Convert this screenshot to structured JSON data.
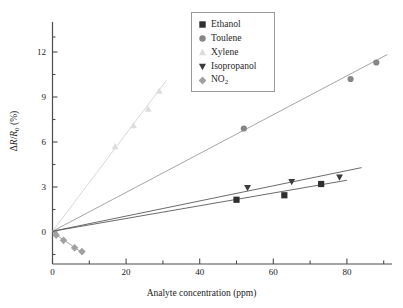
{
  "chart_data": {
    "type": "scatter",
    "title": "",
    "xlabel": "Analyte concentration (ppm)",
    "ylabel": "ΔR/R₀ (%)",
    "xlim": [
      -3,
      92
    ],
    "ylim": [
      -2.1,
      13.6
    ],
    "xticks": [
      0,
      20,
      40,
      60,
      80
    ],
    "yticks": [
      0,
      3,
      6,
      9,
      12
    ],
    "xticklabels": [
      "0",
      "20",
      "40",
      "60",
      "80"
    ],
    "yticklabels": [
      "0",
      "3",
      "6",
      "9",
      "12"
    ],
    "grid": false,
    "legend_position": "top-center-right",
    "fit_lines": true,
    "series": [
      {
        "name": "Ethanol",
        "marker": "square",
        "color": "#2f2f2f",
        "points": [
          [
            50.0,
            2.15
          ],
          [
            63.0,
            2.45
          ],
          [
            73.0,
            3.2
          ]
        ],
        "fit": {
          "slope": 0.0425,
          "intercept": 0.05,
          "x_start": 0,
          "x_end": 80
        }
      },
      {
        "name": "Toulene",
        "marker": "circle",
        "color": "#868686",
        "points": [
          [
            52.0,
            6.9
          ],
          [
            81.0,
            10.2
          ],
          [
            88.0,
            11.3
          ]
        ],
        "fit": {
          "slope": 0.1295,
          "intercept": 0.05,
          "x_start": 0,
          "x_end": 91
        }
      },
      {
        "name": "Xylene",
        "marker": "triangle-up",
        "color": "#dcdcdc",
        "points": [
          [
            17.0,
            5.7
          ],
          [
            22.0,
            7.1
          ],
          [
            26.0,
            8.2
          ],
          [
            29.0,
            9.4
          ]
        ],
        "fit": {
          "slope": 0.325,
          "intercept": 0.05,
          "x_start": 0,
          "x_end": 31
        }
      },
      {
        "name": "Isopropanol",
        "marker": "triangle-down",
        "color": "#3a3a3a",
        "points": [
          [
            53.0,
            2.95
          ],
          [
            65.0,
            3.35
          ],
          [
            78.0,
            3.65
          ]
        ],
        "fit": {
          "slope": 0.0505,
          "intercept": 0.05,
          "x_start": 0,
          "x_end": 84
        }
      },
      {
        "name": "NO2",
        "marker": "diamond",
        "color": "#a0a0a0",
        "points": [
          [
            1.0,
            -0.2
          ],
          [
            3.0,
            -0.55
          ],
          [
            6.0,
            -1.05
          ],
          [
            8.0,
            -1.3
          ]
        ],
        "fit": {
          "slope": -0.168,
          "intercept": -0.02,
          "x_start": 0,
          "x_end": 8.5
        }
      }
    ]
  },
  "legend": {
    "items": [
      {
        "label": "Ethanol",
        "marker": "square",
        "color": "#2f2f2f"
      },
      {
        "label": "Toulene",
        "marker": "circle",
        "color": "#868686"
      },
      {
        "label": "Xylene",
        "marker": "triangle-up",
        "color": "#dcdcdc"
      },
      {
        "label": "Isopropanol",
        "marker": "triangle-down",
        "color": "#3a3a3a"
      },
      {
        "label": "NO",
        "sub": "2",
        "marker": "diamond",
        "color": "#a0a0a0"
      }
    ]
  },
  "axes": {
    "xlabel": "Analyte concentration (ppm)",
    "ylabel_delta": "Δ",
    "ylabel_r": "R",
    "ylabel_slash": "/",
    "ylabel_r0": "R",
    "ylabel_zero": "0",
    "ylabel_pct": " (%)"
  },
  "colors": {
    "axis": "#4d4d4d",
    "background": "#ffffff",
    "legend_border": "#9a9a9a"
  }
}
